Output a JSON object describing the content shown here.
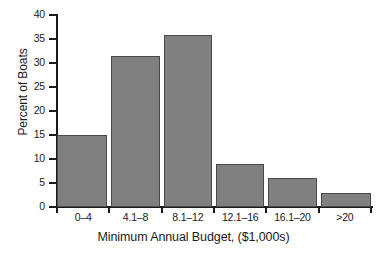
{
  "chart_data": {
    "type": "bar",
    "title": "",
    "xlabel": "Minimum Annual Budget, ($1,000s)",
    "ylabel": "Percent of Boats",
    "categories": [
      "0–4",
      "4.1–8",
      "8.1–12",
      "12.1–16",
      "16.1–20",
      ">20"
    ],
    "values": [
      15,
      31.4,
      35.9,
      9,
      6,
      3
    ],
    "ylim": [
      0,
      40
    ],
    "yticks": [
      0,
      5,
      10,
      15,
      20,
      25,
      30,
      35,
      40
    ],
    "ytick_labels": [
      "0",
      "5",
      "10",
      "15",
      "20",
      "25",
      "30",
      "35",
      "40"
    ],
    "grid": false,
    "legend": false,
    "bar_color": "#808080",
    "bar_edge_color": "#4a4a4a",
    "axis_color": "#1a1a1a",
    "background_color": "#ffffff"
  }
}
